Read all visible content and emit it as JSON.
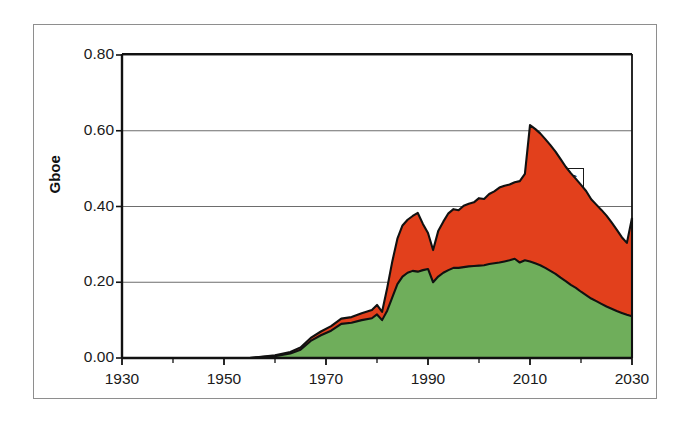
{
  "chart_data": {
    "type": "area",
    "stacked": true,
    "title": "",
    "xlabel": "",
    "ylabel": "Gboe",
    "xlim": [
      1930,
      2030
    ],
    "ylim": [
      0.0,
      0.8
    ],
    "ytick_labels": [
      "0.00",
      "0.20",
      "0.40",
      "0.60",
      "0.80"
    ],
    "ytick_values": [
      0.0,
      0.2,
      0.4,
      0.6,
      0.8
    ],
    "xtick_labels": [
      "1930",
      "1950",
      "1970",
      "1990",
      "2010",
      "2030"
    ],
    "xtick_values": [
      1930,
      1950,
      1970,
      1990,
      2010,
      2030
    ],
    "xminor_step": 10,
    "grid": "horizontal",
    "legend_position": "inline-annotations",
    "colors": {
      "oil": "#6FAE5B",
      "gas": "#E2401C",
      "outline": "#111111",
      "gridline": "#6d6d6d",
      "axis": "#111111",
      "frame": "#8e8e8e",
      "background": "#ffffff"
    },
    "annotations": [
      {
        "text": "Gas",
        "series": "gas",
        "x": 2017,
        "y": 0.47
      },
      {
        "text": "Oil",
        "series": "oil",
        "x": 1996,
        "y": 0.155
      }
    ],
    "series": [
      {
        "name": "Oil",
        "color": "#6FAE5B",
        "x": [
          1930,
          1955,
          1960,
          1963,
          1965,
          1967,
          1969,
          1971,
          1973,
          1975,
          1977,
          1979,
          1980,
          1981,
          1982,
          1983,
          1984,
          1985,
          1986,
          1987,
          1988,
          1989,
          1990,
          1991,
          1992,
          1993,
          1994,
          1995,
          1996,
          1997,
          1998,
          1999,
          2000,
          2001,
          2002,
          2003,
          2004,
          2005,
          2006,
          2007,
          2008,
          2009,
          2010,
          2011,
          2012,
          2013,
          2014,
          2015,
          2016,
          2017,
          2018,
          2019,
          2020,
          2021,
          2022,
          2023,
          2024,
          2025,
          2026,
          2027,
          2028,
          2029,
          2030
        ],
        "values": [
          0.0,
          0.0,
          0.005,
          0.012,
          0.022,
          0.045,
          0.06,
          0.072,
          0.09,
          0.093,
          0.1,
          0.105,
          0.115,
          0.1,
          0.125,
          0.16,
          0.195,
          0.215,
          0.225,
          0.23,
          0.228,
          0.232,
          0.235,
          0.2,
          0.215,
          0.225,
          0.232,
          0.238,
          0.238,
          0.24,
          0.242,
          0.243,
          0.244,
          0.245,
          0.248,
          0.25,
          0.252,
          0.255,
          0.258,
          0.262,
          0.252,
          0.258,
          0.255,
          0.25,
          0.245,
          0.238,
          0.23,
          0.222,
          0.212,
          0.203,
          0.193,
          0.185,
          0.175,
          0.166,
          0.157,
          0.15,
          0.143,
          0.136,
          0.13,
          0.124,
          0.119,
          0.114,
          0.11
        ]
      },
      {
        "name": "Gas",
        "color": "#E2401C",
        "x": [
          1930,
          1955,
          1960,
          1963,
          1965,
          1967,
          1969,
          1971,
          1973,
          1975,
          1977,
          1979,
          1980,
          1981,
          1982,
          1983,
          1984,
          1985,
          1986,
          1987,
          1988,
          1989,
          1990,
          1991,
          1992,
          1993,
          1994,
          1995,
          1996,
          1997,
          1998,
          1999,
          2000,
          2001,
          2002,
          2003,
          2004,
          2005,
          2006,
          2007,
          2008,
          2009,
          2010,
          2011,
          2012,
          2013,
          2014,
          2015,
          2016,
          2017,
          2018,
          2019,
          2020,
          2021,
          2022,
          2023,
          2024,
          2025,
          2026,
          2027,
          2028,
          2029,
          2030
        ],
        "values": [
          0.0,
          0.0,
          0.002,
          0.004,
          0.006,
          0.008,
          0.01,
          0.012,
          0.014,
          0.015,
          0.018,
          0.022,
          0.025,
          0.022,
          0.06,
          0.095,
          0.12,
          0.135,
          0.14,
          0.145,
          0.155,
          0.122,
          0.095,
          0.085,
          0.12,
          0.135,
          0.15,
          0.155,
          0.152,
          0.162,
          0.165,
          0.168,
          0.178,
          0.175,
          0.185,
          0.19,
          0.198,
          0.2,
          0.2,
          0.202,
          0.215,
          0.228,
          0.36,
          0.355,
          0.348,
          0.34,
          0.332,
          0.323,
          0.313,
          0.302,
          0.295,
          0.288,
          0.282,
          0.275,
          0.262,
          0.255,
          0.248,
          0.24,
          0.228,
          0.215,
          0.2,
          0.19,
          0.26
        ]
      }
    ],
    "total_peak": {
      "year": 2010,
      "value": 0.615
    },
    "total_end": {
      "year": 2030,
      "value": 0.37
    }
  },
  "axis": {
    "y_title": "Gboe"
  }
}
